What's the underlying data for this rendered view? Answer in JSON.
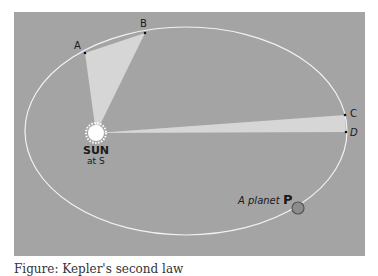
{
  "diagram": {
    "background_color": "#a4a4a4",
    "orbit": {
      "cx": 186,
      "cy": 131,
      "rx": 161,
      "ry": 104,
      "stroke": "#f2f2f2"
    },
    "sun": {
      "label": "SUN",
      "sublabel": "at S",
      "cx": 96,
      "cy": 133,
      "r": 8
    },
    "points": [
      {
        "label": "A",
        "x": 85,
        "y": 53
      },
      {
        "label": "B",
        "x": 145,
        "y": 33
      },
      {
        "label": "C",
        "x": 345,
        "y": 115
      },
      {
        "label": "D",
        "x": 346,
        "y": 132
      }
    ],
    "swept_areas": [
      {
        "from": "A",
        "to": "B",
        "fill": "#d6d6d6"
      },
      {
        "from": "C",
        "to": "D",
        "fill": "#d6d6d6"
      }
    ],
    "planet": {
      "label": "A planet",
      "letter": "P",
      "cx": 298,
      "cy": 208,
      "r": 6,
      "fill": "#8c8c8c"
    }
  },
  "caption": "Figure: Kepler's second law"
}
